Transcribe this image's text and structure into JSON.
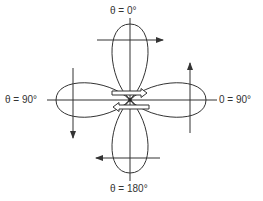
{
  "diagram": {
    "type": "four-lobe radiation / polar pattern",
    "labels": {
      "top": "θ = 0°",
      "left": "θ = 90°",
      "right": "0 = 90°",
      "bottom": "θ = 180°"
    },
    "lobes": [
      "top",
      "bottom",
      "left",
      "right"
    ],
    "field_arrows": {
      "top": "right",
      "bottom": "left",
      "left": "down",
      "right": "up"
    },
    "center_arrows": {
      "upper": "right",
      "lower": "left"
    },
    "colors": {
      "stroke": "#333333",
      "background": "#ffffff"
    }
  }
}
